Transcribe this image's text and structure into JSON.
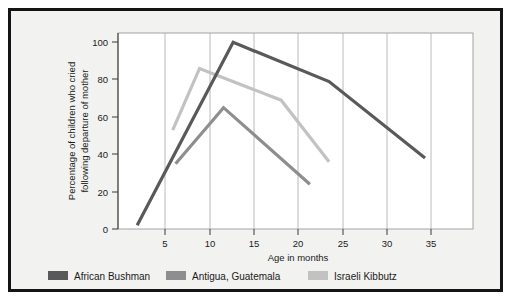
{
  "chart_data": {
    "type": "line",
    "title": "",
    "xlabel": "Age in months",
    "ylabel": "Percentage of children who cried following departure of mother",
    "ylabel_line1": "Percentage of children who cried",
    "ylabel_line2": "following departure of mother",
    "xlim": [
      3,
      40
    ],
    "ylim": [
      0,
      105
    ],
    "xticks": [
      5,
      10,
      15,
      20,
      25,
      30,
      35
    ],
    "xtick_labels": [
      "5",
      "10",
      "15",
      "20",
      "25",
      "30",
      "35"
    ],
    "yticks": [
      0,
      20,
      40,
      60,
      80,
      100
    ],
    "ytick_labels": [
      "0",
      "20",
      "40",
      "60",
      "80",
      "100"
    ],
    "grid": "vertical",
    "legend_position": "below",
    "series": [
      {
        "name": "African Bushman",
        "color": "#59595b",
        "x": [
          5,
          15,
          25,
          35
        ],
        "y": [
          2,
          100,
          79,
          38
        ]
      },
      {
        "name": "Antigua, Guatemala",
        "color": "#8e8e90",
        "x": [
          9,
          14,
          23
        ],
        "y": [
          35,
          65,
          24
        ]
      },
      {
        "name": "Israeli Kibbutz",
        "color": "#c2c2c2",
        "x": [
          8.7,
          11.5,
          20,
          25
        ],
        "y": [
          53,
          86,
          69,
          36
        ]
      }
    ]
  },
  "legend": {
    "items": [
      {
        "label": "African Bushman",
        "color": "#59595b"
      },
      {
        "label": "Antigua, Guatemala",
        "color": "#8e8e90"
      },
      {
        "label": "Israeli Kibbutz",
        "color": "#c2c2c2"
      }
    ]
  },
  "colors": {
    "frame": "#141414",
    "background": "#f2f2f0",
    "plot_background": "#ffffff",
    "gridline": "#a8a8a8",
    "axis": "#4a4a4a",
    "text": "#1a1a1a"
  }
}
